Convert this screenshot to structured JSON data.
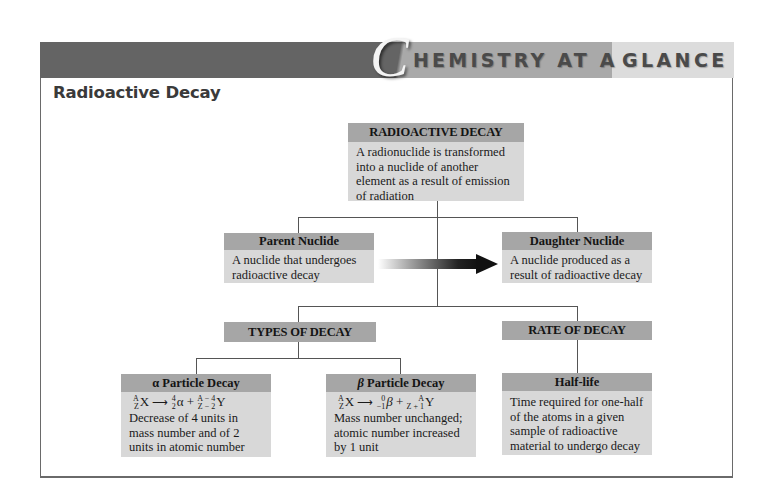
{
  "banner": {
    "initial": "C",
    "title_part1": "HEMISTRY AT A",
    "title_part2": "GLANCE",
    "colors": {
      "dark": "#646464",
      "mid": "#a9a9a9",
      "light": "#dcdcdc"
    }
  },
  "section_title": "Radioactive Decay",
  "nodes": {
    "root": {
      "title": "RADIOACTIVE DECAY",
      "body": "A radionuclide is transformed into a nuclide of another element as a result of emission of radiation"
    },
    "parent": {
      "title": "Parent Nuclide",
      "body": "A nuclide that undergoes radioactive decay"
    },
    "daughter": {
      "title": "Daughter Nuclide",
      "body": "A nuclide produced as a result of radioactive decay"
    },
    "types": {
      "title": "TYPES OF DECAY"
    },
    "rate": {
      "title": "RATE OF DECAY"
    },
    "alpha": {
      "title_symbol": "α",
      "title": "Particle Decay",
      "equation": {
        "reactant": {
          "symbol": "X",
          "mass": "A",
          "atomic": "Z"
        },
        "particle": {
          "symbol": "α",
          "mass": "4",
          "atomic": "2"
        },
        "plus": "+",
        "product": {
          "symbol": "Y",
          "mass": "A − 4",
          "atomic": "Z − 2"
        }
      },
      "body": "Decrease of 4 units in mass number and of 2 units in atomic number"
    },
    "beta": {
      "title_symbol": "β",
      "title": "Particle Decay",
      "equation": {
        "reactant": {
          "symbol": "X",
          "mass": "A",
          "atomic": "Z"
        },
        "particle": {
          "symbol": "β",
          "mass": "0",
          "atomic": "−1"
        },
        "plus": "+",
        "product": {
          "symbol": "Y",
          "mass": "A",
          "atomic": "Z + 1"
        }
      },
      "body": "Mass number unchanged; atomic number increased by 1 unit"
    },
    "halflife": {
      "title": "Half-life",
      "body": "Time required for one-half of the atoms in a given sample of radioactive material to undergo decay"
    }
  },
  "edges": [
    [
      "root",
      "parent"
    ],
    [
      "root",
      "daughter"
    ],
    [
      "parent",
      "daughter"
    ],
    [
      "root",
      "types"
    ],
    [
      "root",
      "rate"
    ],
    [
      "types",
      "alpha"
    ],
    [
      "types",
      "beta"
    ],
    [
      "rate",
      "halflife"
    ]
  ],
  "arrow_glyph": "⟶"
}
